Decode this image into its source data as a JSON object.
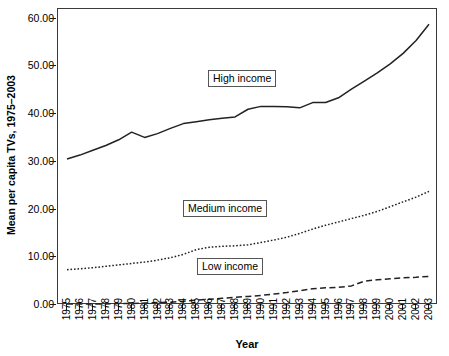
{
  "chart": {
    "y_axis_title": "Mean per capita TVs, 1975–2003",
    "x_axis_title": "Year",
    "y_tick_labels": [
      "60.00",
      "50.00",
      "40.00",
      "30.00",
      "20.00",
      "10.00",
      "0.00"
    ],
    "series_labels": {
      "high": "High income",
      "medium": "Medium income",
      "low": "Low income"
    }
  },
  "chart_data": {
    "type": "line",
    "title": "",
    "xlabel": "Year",
    "ylabel": "Mean per capita TVs, 1975–2003",
    "xlim": [
      1975,
      2003
    ],
    "ylim": [
      0,
      62
    ],
    "yticks": [
      0,
      10,
      20,
      30,
      40,
      50,
      60
    ],
    "ytick_labels": [
      "0.00",
      "10.00",
      "20.00",
      "30.00",
      "40.00",
      "50.00",
      "60.00"
    ],
    "grid": false,
    "legend": "inline-boxed-labels",
    "categories": [
      1975,
      1976,
      1977,
      1978,
      1979,
      1980,
      1981,
      1982,
      1983,
      1984,
      1985,
      1986,
      1987,
      1988,
      1989,
      1990,
      1991,
      1992,
      1993,
      1994,
      1995,
      1996,
      1997,
      1998,
      1999,
      2000,
      2001,
      2002,
      2003
    ],
    "series": [
      {
        "name": "High income",
        "style": "solid",
        "color": "#222222",
        "values": [
          30.6,
          31.4,
          32.4,
          33.4,
          34.6,
          36.2,
          35.1,
          35.9,
          37.0,
          38.0,
          38.4,
          38.8,
          39.1,
          39.4,
          41.0,
          41.6,
          41.6,
          41.5,
          41.3,
          42.4,
          42.4,
          43.4,
          45.2,
          46.9,
          48.6,
          50.5,
          52.7,
          55.4,
          58.8
        ]
      },
      {
        "name": "Medium income",
        "style": "dotted",
        "color": "#222222",
        "values": [
          7.4,
          7.6,
          7.8,
          8.1,
          8.4,
          8.7,
          9.0,
          9.4,
          9.9,
          10.6,
          11.6,
          12.1,
          12.3,
          12.4,
          12.6,
          13.1,
          13.6,
          14.2,
          15.0,
          15.9,
          16.7,
          17.4,
          18.1,
          18.8,
          19.6,
          20.6,
          21.6,
          22.6,
          23.8
        ]
      },
      {
        "name": "Low income",
        "style": "dashed",
        "color": "#222222",
        "values": [
          0.2,
          0.2,
          0.2,
          0.2,
          0.3,
          0.3,
          0.4,
          0.5,
          0.6,
          0.8,
          1.0,
          1.2,
          1.4,
          1.6,
          1.8,
          2.0,
          2.3,
          2.6,
          3.0,
          3.4,
          3.6,
          3.7,
          4.0,
          5.0,
          5.3,
          5.5,
          5.7,
          5.8,
          6.0
        ]
      }
    ]
  }
}
